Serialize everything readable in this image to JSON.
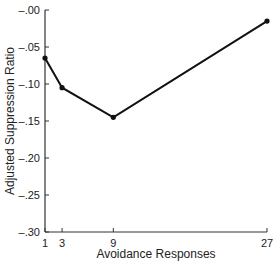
{
  "chart_data": {
    "type": "line",
    "title": "",
    "xlabel": "Avoidance Responses",
    "ylabel": "Adjusted Suppression Ratio",
    "x": [
      1,
      3,
      9,
      27
    ],
    "series": [
      {
        "name": "Adjusted Suppression Ratio",
        "values": [
          -0.065,
          -0.105,
          -0.145,
          -0.015
        ]
      }
    ],
    "xticks": [
      "1",
      "3",
      "9",
      "27"
    ],
    "yticks": [
      "-.00",
      "-.05",
      "-.10",
      "-.15",
      "-.20",
      "-.25",
      "-.30"
    ],
    "ylim": [
      -0.3,
      0.0
    ],
    "xlim": [
      1,
      27
    ],
    "grid": false,
    "legend": "none"
  }
}
